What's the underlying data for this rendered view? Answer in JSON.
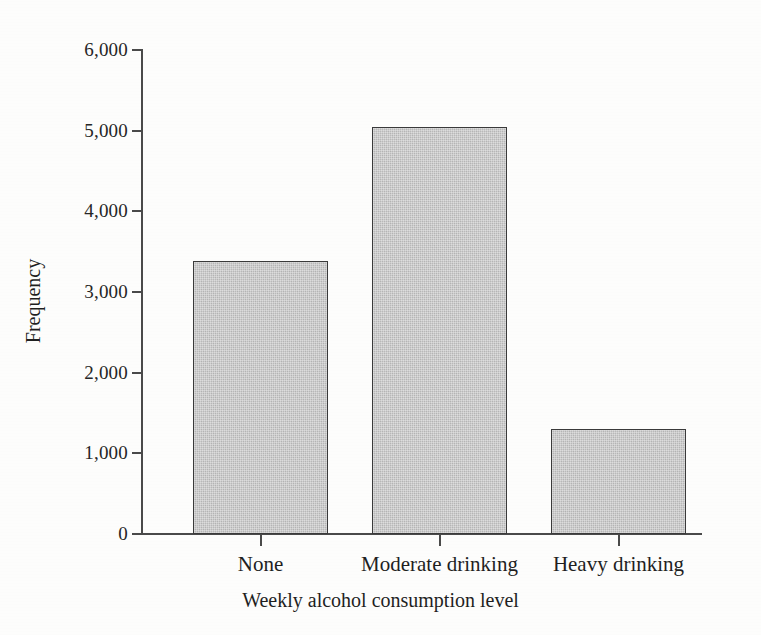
{
  "chart_data": {
    "type": "bar",
    "title": "",
    "xlabel": "Weekly alcohol consumption level",
    "ylabel": "Frequency",
    "categories": [
      "None",
      "Moderate drinking",
      "Heavy drinking"
    ],
    "values": [
      3380,
      5050,
      1300
    ],
    "ylim": [
      0,
      6000
    ],
    "ytick_labels": [
      "0",
      "1,000",
      "2,000",
      "3,000",
      "4,000",
      "5,000",
      "6,000"
    ],
    "ytick_values": [
      0,
      1000,
      2000,
      3000,
      4000,
      5000,
      6000
    ],
    "grid": false,
    "legend": false,
    "legend_position": "none",
    "bar_fill_color": "#b9b9b9",
    "bar_border_color": "#3a3a3a",
    "axis_color": "#4a4a4a",
    "background_color": "#fdfdfc"
  }
}
